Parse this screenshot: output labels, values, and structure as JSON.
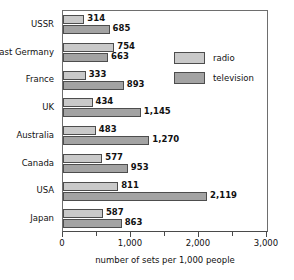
{
  "chart_data": {
    "type": "bar",
    "orientation": "horizontal",
    "title": "",
    "xlabel": "number of sets per 1,000 people",
    "ylabel": "",
    "xlim": [
      0,
      3000
    ],
    "xticks": [
      0,
      1000,
      2000,
      3000
    ],
    "xticklabels": [
      "0",
      "1,000",
      "2,000",
      "3,000"
    ],
    "minor_xticks": [
      500,
      1500,
      2500
    ],
    "grid": false,
    "legend_position": "upper-right-inside",
    "categories": [
      "USSR",
      "East Germany",
      "France",
      "UK",
      "Australia",
      "Canada",
      "USA",
      "Japan"
    ],
    "series": [
      {
        "name": "radio",
        "color": "#c9c9c9",
        "values": [
          314,
          754,
          333,
          434,
          483,
          577,
          811,
          587
        ],
        "labels": [
          "314",
          "754",
          "333",
          "434",
          "483",
          "577",
          "811",
          "587"
        ]
      },
      {
        "name": "television",
        "color": "#a3a3a3",
        "values": [
          685,
          663,
          893,
          1145,
          1270,
          953,
          2119,
          863
        ],
        "labels": [
          "685",
          "663",
          "893",
          "1,145",
          "1,270",
          "953",
          "2,119",
          "863"
        ]
      }
    ]
  },
  "legend": {
    "items": [
      {
        "label": "radio",
        "color": "#c9c9c9"
      },
      {
        "label": "television",
        "color": "#a3a3a3"
      }
    ]
  },
  "colors": {
    "radio": "#c9c9c9",
    "television": "#a3a3a3",
    "axis": "#4a4a4a",
    "frame": "#6e6e6e",
    "background": "#ffffff",
    "text": "#111111"
  }
}
